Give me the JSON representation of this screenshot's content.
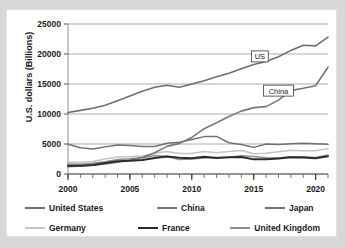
{
  "chart_data": {
    "type": "line",
    "title": "",
    "xlabel": "",
    "ylabel": "U.S. dollars (Billions)",
    "xlim": [
      2000,
      2021
    ],
    "ylim": [
      0,
      25000
    ],
    "y_ticks": [
      "0",
      "5000",
      "10000",
      "15000",
      "20000",
      "25000"
    ],
    "x_ticks": [
      "2000",
      "2005",
      "2010",
      "2015",
      "2020"
    ],
    "grid": "horizontal",
    "legend_position": "bottom",
    "minor_x_ticks": "yearly",
    "x": [
      2000,
      2001,
      2002,
      2003,
      2004,
      2005,
      2006,
      2007,
      2008,
      2009,
      2010,
      2011,
      2012,
      2013,
      2014,
      2015,
      2016,
      2017,
      2018,
      2019,
      2020,
      2021
    ],
    "series": [
      {
        "name": "United States",
        "color": "#6e6e6e",
        "width": 1.6,
        "values": [
          10250,
          10600,
          10950,
          11450,
          12200,
          13000,
          13800,
          14450,
          14800,
          14450,
          15000,
          15550,
          16200,
          16800,
          17550,
          18250,
          18750,
          19550,
          20600,
          21450,
          21350,
          22800
        ]
      },
      {
        "name": "China",
        "color": "#777777",
        "width": 1.6,
        "values": [
          1210,
          1340,
          1470,
          1660,
          1960,
          2290,
          2750,
          3550,
          4600,
          5100,
          6090,
          7550,
          8530,
          9570,
          10480,
          11060,
          11230,
          12310,
          13890,
          14280,
          14720,
          17800
        ]
      },
      {
        "name": "Japan",
        "color": "#707070",
        "width": 1.5,
        "values": [
          4970,
          4380,
          4180,
          4520,
          4820,
          4760,
          4600,
          4580,
          5110,
          5290,
          5760,
          6230,
          6270,
          5210,
          4900,
          4440,
          5000,
          4930,
          5040,
          5120,
          5050,
          4940
        ]
      },
      {
        "name": "Germany",
        "color": "#c4c4c4",
        "width": 1.5,
        "values": [
          1950,
          1950,
          2080,
          2510,
          2820,
          2860,
          3000,
          3440,
          3750,
          3420,
          3400,
          3750,
          3540,
          3750,
          3900,
          3360,
          3470,
          3690,
          3970,
          3890,
          3890,
          4260
        ]
      },
      {
        "name": "France",
        "color": "#2b2b2b",
        "width": 2.0,
        "values": [
          1370,
          1380,
          1500,
          1850,
          2120,
          2200,
          2320,
          2660,
          2930,
          2700,
          2640,
          2860,
          2680,
          2810,
          2850,
          2440,
          2470,
          2590,
          2790,
          2730,
          2640,
          2960
        ]
      },
      {
        "name": "United Kingdom",
        "color": "#8e8e8e",
        "width": 1.5,
        "values": [
          1660,
          1640,
          1790,
          2050,
          2420,
          2540,
          2710,
          3090,
          2930,
          2410,
          2490,
          2680,
          2740,
          2800,
          3060,
          2930,
          2700,
          2680,
          2870,
          2880,
          2760,
          3190
        ]
      }
    ],
    "annotations": [
      {
        "text": "US",
        "x": 2015.5,
        "y": 19600
      },
      {
        "text": "China",
        "x": 2017.0,
        "y": 13900
      }
    ]
  }
}
